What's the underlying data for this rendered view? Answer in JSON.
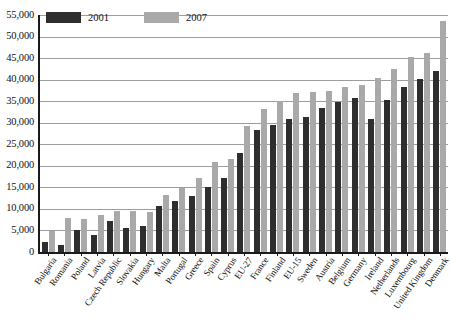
{
  "chart_data": {
    "type": "bar",
    "title": "",
    "subtitle": "",
    "xlabel": "",
    "ylabel": "",
    "ylim": [
      0,
      55000
    ],
    "ytick_step": 5000,
    "grid": true,
    "legend_position": "top-left",
    "categories": [
      "Bulgaria",
      "Romania",
      "Poland",
      "Latvia",
      "Czech Republic",
      "Slovakia",
      "Hungary",
      "Malta",
      "Portugal",
      "Greece",
      "Spain",
      "Cyprus",
      "EU-27",
      "France",
      "Finland",
      "EU-15",
      "Sweden",
      "Austria",
      "Belgium",
      "Germany",
      "Ireland",
      "Netherlands",
      "Luxembourg",
      "United Kingdom",
      "Denmark"
    ],
    "ytick_labels": [
      "0",
      "5,000",
      "10,000",
      "15,000",
      "20,000",
      "25,000",
      "30,000",
      "35,000",
      "40,000",
      "45,000",
      "50,000",
      "55,000"
    ],
    "ytick_values": [
      0,
      5000,
      10000,
      15000,
      20000,
      25000,
      30000,
      35000,
      40000,
      45000,
      50000,
      55000
    ],
    "series": [
      {
        "name": "2001",
        "color": "#2e2e2e",
        "values": [
          2300,
          1700,
          5200,
          3900,
          7300,
          5500,
          6000,
          10700,
          11900,
          13000,
          15200,
          17200,
          23000,
          28300,
          29500,
          30800,
          31300,
          33400,
          34700,
          35800,
          30900,
          35200,
          38400,
          40100,
          42100
        ]
      },
      {
        "name": "2007",
        "color": "#a9a9a9",
        "values": [
          4900,
          8000,
          7600,
          8700,
          9600,
          9600,
          9300,
          13200,
          14800,
          17200,
          20900,
          21500,
          29300,
          33200,
          35000,
          36900,
          37100,
          37400,
          38200,
          38700,
          40400,
          42400,
          45300,
          46200,
          53700
        ]
      }
    ]
  }
}
